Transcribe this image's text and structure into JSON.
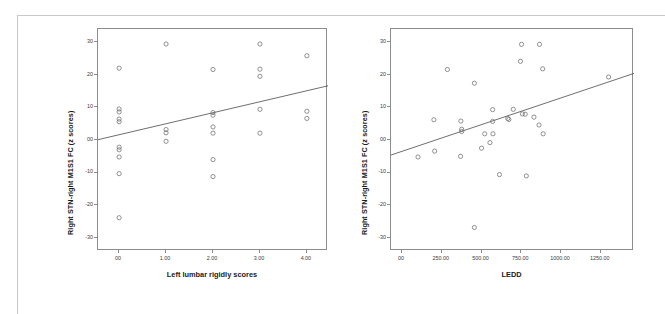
{
  "figure": {
    "background_color": "#ffffff",
    "frame_color": "#c9c9c9",
    "axis_color": "#8c8c8c",
    "marker_color": "#6e6e6e",
    "fitline_color": "#4a4a4a"
  },
  "chart_data": [
    {
      "type": "scatter",
      "panel": "left",
      "title": "",
      "xlabel": "Left lumbar rigidly scores",
      "ylabel": "Right STN-right M1S1 FC (z scores)",
      "xlim": [
        -0.45,
        4.45
      ],
      "ylim": [
        -34,
        34
      ],
      "xticks": [
        0,
        1,
        2,
        3,
        4
      ],
      "xticklabels": [
        "00",
        "1.00",
        "2.00",
        "3.00",
        "4.00"
      ],
      "yticks": [
        30,
        20,
        10,
        0,
        -10,
        -20,
        -30
      ],
      "yticklabels": [
        "30",
        "20",
        "10",
        "00",
        "-10",
        "-20",
        "-30"
      ],
      "grid": false,
      "legend": false,
      "points": [
        {
          "x": 0.0,
          "y": 22.0
        },
        {
          "x": 0.0,
          "y": 9.5
        },
        {
          "x": 0.0,
          "y": 8.6
        },
        {
          "x": 0.0,
          "y": 6.4
        },
        {
          "x": 0.0,
          "y": 5.6
        },
        {
          "x": 0.0,
          "y": -2.2
        },
        {
          "x": 0.0,
          "y": -3.0
        },
        {
          "x": 0.0,
          "y": -5.2
        },
        {
          "x": 0.0,
          "y": -10.3
        },
        {
          "x": 0.0,
          "y": -23.8
        },
        {
          "x": 1.0,
          "y": 29.4
        },
        {
          "x": 1.0,
          "y": 3.2
        },
        {
          "x": 1.0,
          "y": 2.2
        },
        {
          "x": 1.0,
          "y": -0.4
        },
        {
          "x": 2.0,
          "y": 21.6
        },
        {
          "x": 2.0,
          "y": 8.4
        },
        {
          "x": 2.0,
          "y": 7.6
        },
        {
          "x": 2.0,
          "y": 4.0
        },
        {
          "x": 2.0,
          "y": 2.1
        },
        {
          "x": 2.0,
          "y": -6.0
        },
        {
          "x": 2.0,
          "y": -11.2
        },
        {
          "x": 3.0,
          "y": 29.4
        },
        {
          "x": 3.0,
          "y": 21.7
        },
        {
          "x": 3.0,
          "y": 19.5
        },
        {
          "x": 3.0,
          "y": 9.4
        },
        {
          "x": 3.0,
          "y": 2.1
        },
        {
          "x": 4.0,
          "y": 25.8
        },
        {
          "x": 4.0,
          "y": 8.8
        },
        {
          "x": 4.0,
          "y": 6.6
        }
      ],
      "fit_line": {
        "x1": -0.45,
        "y1": 0.1,
        "x2": 4.45,
        "y2": 16.6
      }
    },
    {
      "type": "scatter",
      "panel": "right",
      "title": "",
      "xlabel": "LEDD",
      "ylabel": "Right STN-right M1S1 FC (z scores)",
      "xlim": [
        -70,
        1460
      ],
      "ylim": [
        -34,
        34
      ],
      "xticks": [
        0,
        250,
        500,
        750,
        1000,
        1250
      ],
      "xticklabels": [
        "00",
        "250.00",
        "500.00",
        "750.00",
        "1000.00",
        "1250.00"
      ],
      "yticks": [
        30,
        20,
        10,
        0,
        -10,
        -20,
        -30
      ],
      "yticklabels": [
        "30",
        "20",
        "10",
        "00",
        "-10",
        "-20",
        "-30"
      ],
      "grid": false,
      "legend": false,
      "points": [
        {
          "x": 100,
          "y": -5.2
        },
        {
          "x": 200,
          "y": 6.2
        },
        {
          "x": 205,
          "y": -3.4
        },
        {
          "x": 285,
          "y": 21.6
        },
        {
          "x": 370,
          "y": 5.8
        },
        {
          "x": 375,
          "y": 3.3
        },
        {
          "x": 375,
          "y": 2.6
        },
        {
          "x": 368,
          "y": -5.0
        },
        {
          "x": 455,
          "y": 17.4
        },
        {
          "x": 455,
          "y": -26.8
        },
        {
          "x": 500,
          "y": -2.5
        },
        {
          "x": 520,
          "y": 1.9
        },
        {
          "x": 570,
          "y": 9.3
        },
        {
          "x": 570,
          "y": 5.7
        },
        {
          "x": 572,
          "y": 1.9
        },
        {
          "x": 553,
          "y": -0.8
        },
        {
          "x": 613,
          "y": -10.6
        },
        {
          "x": 665,
          "y": 6.6
        },
        {
          "x": 672,
          "y": 6.3
        },
        {
          "x": 700,
          "y": 9.4
        },
        {
          "x": 745,
          "y": 24.1
        },
        {
          "x": 752,
          "y": 29.3
        },
        {
          "x": 757,
          "y": 8.0
        },
        {
          "x": 775,
          "y": 7.9
        },
        {
          "x": 782,
          "y": -11.0
        },
        {
          "x": 830,
          "y": 7.0
        },
        {
          "x": 865,
          "y": 29.3
        },
        {
          "x": 862,
          "y": 4.6
        },
        {
          "x": 885,
          "y": 21.8
        },
        {
          "x": 888,
          "y": 1.9
        },
        {
          "x": 1300,
          "y": 19.3
        }
      ],
      "fit_line": {
        "x1": -70,
        "y1": -4.6,
        "x2": 1460,
        "y2": 20.4
      }
    }
  ]
}
